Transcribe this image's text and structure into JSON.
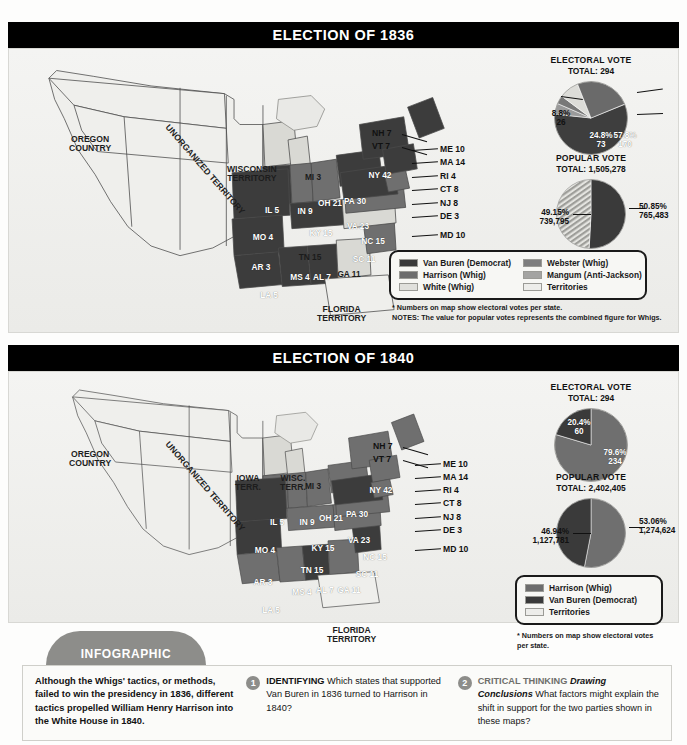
{
  "sections": [
    {
      "id": "e1836",
      "title": "ELECTION OF 1836",
      "electoral": {
        "heading": "ELECTORAL VOTE",
        "total": "TOTAL: 294",
        "slices": [
          {
            "label": "57.8%\n170",
            "pct": 57.8,
            "votes": 170,
            "color": "#3e3e3e",
            "name": "Van Buren (Democrat)"
          },
          {
            "label": "4.8%\n14",
            "pct": 4.8,
            "votes": 14,
            "color": "#9a9a9a",
            "name": "Mangum (Anti-Jackson)"
          },
          {
            "label": "3.7%\n11",
            "pct": 3.7,
            "votes": 11,
            "color": "#787878",
            "name": "Webster (Whig)"
          },
          {
            "label": "8.8%\n26",
            "pct": 8.8,
            "votes": 26,
            "color": "#dcdcd8",
            "name": "White (Whig)"
          },
          {
            "label": "24.8%\n73",
            "pct": 24.8,
            "votes": 73,
            "color": "#6a6a6a",
            "name": "Harrison (Whig)"
          }
        ]
      },
      "popular": {
        "heading": "POPULAR VOTE",
        "total": "TOTAL: 1,505,278",
        "left_label": "49.15%\n739,795",
        "right_label": "50.85%\n765,483",
        "left_pct": 49.15,
        "right_pct": 50.85,
        "left_votes": "739,795",
        "right_votes": "765,483",
        "left_style": "striped",
        "right_color": "#3a3a3a"
      },
      "legend": [
        {
          "label": "Van Buren (Democrat)",
          "color": "#3a3a3a"
        },
        {
          "label": "Harrison (Whig)",
          "color": "#6d6d6d"
        },
        {
          "label": "White (Whig)",
          "color": "#e0e0dc"
        },
        {
          "label": "Webster (Whig)",
          "color": "#7e7e7e"
        },
        {
          "label": "Mangum (Anti-Jackson)",
          "color": "#a4a4a2"
        },
        {
          "label": "Territories",
          "color": "#ededea"
        }
      ],
      "footnotes": [
        "* Numbers on map show electoral votes per state.",
        "NOTES:  The value for popular votes represents the combined figure for Whigs."
      ],
      "territories": [
        {
          "text": "OREGON\nCOUNTRY",
          "x": 42,
          "y": 78,
          "rot": false
        },
        {
          "text": "UNORGANIZED TERRITORY",
          "x": 120,
          "y": 108,
          "rot": true
        },
        {
          "text": "WISCONSIN\nTERRITORY",
          "x": 200,
          "y": 108,
          "rot": false
        },
        {
          "text": "FLORIDA\nTERRITORY",
          "x": 290,
          "y": 248,
          "rot": false
        }
      ],
      "states": [
        {
          "code": "MI 3",
          "x": 286,
          "y": 116,
          "tone": "light"
        },
        {
          "code": "IL 5",
          "x": 245,
          "y": 149,
          "tone": "dark"
        },
        {
          "code": "IN 9",
          "x": 278,
          "y": 150,
          "tone": "mid"
        },
        {
          "code": "OH 21",
          "x": 303,
          "y": 142,
          "tone": "mid"
        },
        {
          "code": "KY 15",
          "x": 294,
          "y": 172,
          "tone": "dark"
        },
        {
          "code": "MO 4",
          "x": 236,
          "y": 176,
          "tone": "dark"
        },
        {
          "code": "AR 3",
          "x": 234,
          "y": 206,
          "tone": "dark"
        },
        {
          "code": "LA 5",
          "x": 242,
          "y": 234,
          "tone": "dark"
        },
        {
          "code": "MS 4",
          "x": 273,
          "y": 216,
          "tone": "dark"
        },
        {
          "code": "AL 7",
          "x": 295,
          "y": 216,
          "tone": "dark"
        },
        {
          "code": "GA 11",
          "x": 322,
          "y": 213,
          "tone": "light"
        },
        {
          "code": "SC 11",
          "x": 337,
          "y": 198,
          "tone": "mid"
        },
        {
          "code": "NC 15",
          "x": 346,
          "y": 180,
          "tone": "mid"
        },
        {
          "code": "TN 15",
          "x": 283,
          "y": 196,
          "tone": "light"
        },
        {
          "code": "VA 23",
          "x": 331,
          "y": 165,
          "tone": "dark"
        },
        {
          "code": "PA 30",
          "x": 328,
          "y": 140,
          "tone": "dark"
        },
        {
          "code": "NY 42",
          "x": 353,
          "y": 114,
          "tone": "dark"
        }
      ],
      "callouts": [
        {
          "text": "NH 7",
          "x": 345,
          "y": 72
        },
        {
          "text": "VT 7",
          "x": 345,
          "y": 85
        },
        {
          "text": "ME 10",
          "x": 413,
          "y": 88
        },
        {
          "text": "MA 14",
          "x": 413,
          "y": 101
        },
        {
          "text": "RI 4",
          "x": 413,
          "y": 115
        },
        {
          "text": "CT 8",
          "x": 413,
          "y": 128
        },
        {
          "text": "NJ 8",
          "x": 413,
          "y": 142
        },
        {
          "text": "DE 3",
          "x": 413,
          "y": 155
        },
        {
          "text": "MD 10",
          "x": 413,
          "y": 174
        }
      ]
    },
    {
      "id": "e1840",
      "title": "ELECTION OF 1840",
      "electoral": {
        "heading": "ELECTORAL VOTE",
        "total": "TOTAL: 294",
        "slices": [
          {
            "label": "79.6%\n234",
            "pct": 79.6,
            "votes": 234,
            "color": "#6f6f6f",
            "name": "Harrison (Whig)"
          },
          {
            "label": "20.4%\n60",
            "pct": 20.4,
            "votes": 60,
            "color": "#3a3a3a",
            "name": "Van Buren (Democrat)"
          }
        ]
      },
      "popular": {
        "heading": "POPULAR VOTE",
        "total": "TOTAL: 2,402,405",
        "left_label": "46.94%\n1,127,781",
        "right_label": "53.06%\n1,274,624",
        "left_pct": 46.94,
        "right_pct": 53.06,
        "left_votes": "1,127,781",
        "right_votes": "1,274,624",
        "left_style": "solid-dark",
        "right_color": "#6f6f6f"
      },
      "legend": [
        {
          "label": "Harrison (Whig)",
          "color": "#6d6d6d"
        },
        {
          "label": "Van Buren (Democrat)",
          "color": "#3a3a3a"
        },
        {
          "label": "Territories",
          "color": "#ededea"
        }
      ],
      "footnotes": [
        "* Numbers on map show electoral votes",
        "per state."
      ],
      "territories": [
        {
          "text": "OREGON\nCOUNTRY",
          "x": 42,
          "y": 72,
          "rot": false
        },
        {
          "text": "UNORGANIZED TERRITORY",
          "x": 120,
          "y": 104,
          "rot": true
        },
        {
          "text": "IOWA\nTERR.",
          "x": 208,
          "y": 96,
          "rot": false
        },
        {
          "text": "WISC.\nTERR.",
          "x": 253,
          "y": 96,
          "rot": false
        },
        {
          "text": "FLORIDA\nTERRITORY",
          "x": 300,
          "y": 248,
          "rot": false
        }
      ],
      "states": [
        {
          "code": "MI 3",
          "x": 286,
          "y": 104,
          "tone": "light"
        },
        {
          "code": "IL 5",
          "x": 250,
          "y": 140,
          "tone": "mid"
        },
        {
          "code": "IN 9",
          "x": 280,
          "y": 140,
          "tone": "mid"
        },
        {
          "code": "OH 21",
          "x": 304,
          "y": 136,
          "tone": "mid"
        },
        {
          "code": "KY 15",
          "x": 296,
          "y": 166,
          "tone": "mid"
        },
        {
          "code": "MO 4",
          "x": 238,
          "y": 168,
          "tone": "dark"
        },
        {
          "code": "AR 3",
          "x": 236,
          "y": 200,
          "tone": "dark"
        },
        {
          "code": "LA 5",
          "x": 244,
          "y": 228,
          "tone": "mid"
        },
        {
          "code": "MS 4",
          "x": 275,
          "y": 210,
          "tone": "mid"
        },
        {
          "code": "AL 7",
          "x": 298,
          "y": 208,
          "tone": "dark"
        },
        {
          "code": "GA 11",
          "x": 322,
          "y": 208,
          "tone": "mid"
        },
        {
          "code": "SC 11",
          "x": 340,
          "y": 192,
          "tone": "dark"
        },
        {
          "code": "NC 15",
          "x": 348,
          "y": 175,
          "tone": "mid"
        },
        {
          "code": "TN 15",
          "x": 285,
          "y": 188,
          "tone": "mid"
        },
        {
          "code": "VA 23",
          "x": 332,
          "y": 158,
          "tone": "dark"
        },
        {
          "code": "PA 30",
          "x": 330,
          "y": 132,
          "tone": "mid"
        },
        {
          "code": "NY 42",
          "x": 354,
          "y": 108,
          "tone": "mid"
        }
      ],
      "callouts": [
        {
          "text": "NH 7",
          "x": 346,
          "y": 64
        },
        {
          "text": "VT 7",
          "x": 346,
          "y": 77
        },
        {
          "text": "ME 10",
          "x": 416,
          "y": 82
        },
        {
          "text": "MA 14",
          "x": 416,
          "y": 95
        },
        {
          "text": "RI 4",
          "x": 416,
          "y": 108
        },
        {
          "text": "CT 8",
          "x": 416,
          "y": 121
        },
        {
          "text": "NJ 8",
          "x": 416,
          "y": 135
        },
        {
          "text": "DE 3",
          "x": 416,
          "y": 148
        },
        {
          "text": "MD 10",
          "x": 416,
          "y": 167
        }
      ]
    }
  ],
  "infographic": {
    "tab_label": "INFOGRAPHIC",
    "lead": "Although the Whigs' tactics, or methods, failed to win the presidency in 1836, different tactics propelled William Henry Harrison into the White House in 1840.",
    "questions": [
      {
        "num": "1",
        "caption": "IDENTIFYING",
        "caption_style": "bold",
        "emphasis": "",
        "text": "Which states that supported Van Buren in 1836 turned to Harrison in 1840?"
      },
      {
        "num": "2",
        "caption": "CRITICAL THINKING",
        "caption_style": "gray",
        "emphasis": "Drawing Conclusions",
        "text": "What factors might explain the shift in support for the two parties shown in these maps?"
      }
    ]
  },
  "chart_data": [
    {
      "type": "pie",
      "title": "ELECTORAL VOTE TOTAL: 294",
      "election": "1836",
      "categories": [
        "Van Buren (Democrat)",
        "Harrison (Whig)",
        "White (Whig)",
        "Mangum (Anti-Jackson)",
        "Webster (Whig)"
      ],
      "values": [
        170,
        73,
        26,
        14,
        11
      ],
      "percents": [
        57.8,
        24.8,
        8.8,
        4.8,
        3.7
      ],
      "total": 294,
      "legend": "labeled-on-slices"
    },
    {
      "type": "pie",
      "title": "POPULAR VOTE TOTAL: 1,505,278",
      "election": "1836",
      "categories": [
        "Van Buren (Democrat)",
        "Whigs (combined)"
      ],
      "values": [
        765483,
        739795
      ],
      "percents": [
        50.85,
        49.15
      ],
      "total": 1505278,
      "legend": "labeled-outside"
    },
    {
      "type": "pie",
      "title": "ELECTORAL VOTE TOTAL: 294",
      "election": "1840",
      "categories": [
        "Harrison (Whig)",
        "Van Buren (Democrat)"
      ],
      "values": [
        234,
        60
      ],
      "percents": [
        79.6,
        20.4
      ],
      "total": 294,
      "legend": "labeled-on-slices"
    },
    {
      "type": "pie",
      "title": "POPULAR VOTE TOTAL: 2,402,405",
      "election": "1840",
      "categories": [
        "Harrison (Whig)",
        "Van Buren (Democrat)"
      ],
      "values": [
        1274624,
        1127781
      ],
      "percents": [
        53.06,
        46.94
      ],
      "total": 2402405,
      "legend": "labeled-outside"
    }
  ]
}
